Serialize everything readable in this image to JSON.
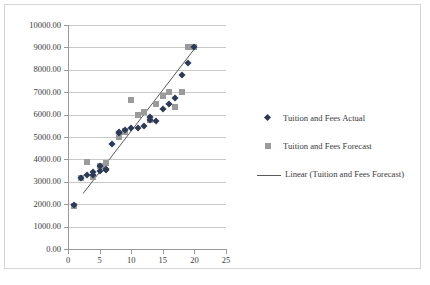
{
  "chart_data": {
    "type": "scatter",
    "title": "",
    "xlabel": "",
    "ylabel": "",
    "xlim": [
      0,
      25
    ],
    "ylim": [
      0,
      10000
    ],
    "grid": true,
    "legend_position": "right",
    "y_ticks": [
      "0.00",
      "1000.00",
      "2000.00",
      "3000.00",
      "4000.00",
      "5000.00",
      "6000.00",
      "7000.00",
      "8000.00",
      "9000.00",
      "10000.00"
    ],
    "y_tick_values": [
      0,
      1000,
      2000,
      3000,
      4000,
      5000,
      6000,
      7000,
      8000,
      9000,
      10000
    ],
    "x_ticks": [
      "0",
      "5",
      "10",
      "15",
      "20",
      "25"
    ],
    "x_tick_values": [
      0,
      5,
      10,
      15,
      20,
      25
    ],
    "series": [
      {
        "name": "Tuition and Fees Actual",
        "marker": "diamond",
        "color": "#2d3a55",
        "points": [
          [
            1,
            1950
          ],
          [
            2,
            3170
          ],
          [
            3,
            3300
          ],
          [
            4,
            3320
          ],
          [
            4,
            3420
          ],
          [
            5,
            3480
          ],
          [
            5,
            3700
          ],
          [
            6,
            3520
          ],
          [
            6,
            3560
          ],
          [
            7,
            4700
          ],
          [
            8,
            5180
          ],
          [
            8,
            5230
          ],
          [
            9,
            5330
          ],
          [
            10,
            5420
          ],
          [
            11,
            5400
          ],
          [
            12,
            5500
          ],
          [
            13,
            5900
          ],
          [
            13,
            5760
          ],
          [
            14,
            5720
          ],
          [
            15,
            6240
          ],
          [
            16,
            6480
          ],
          [
            17,
            6720
          ],
          [
            18,
            7760
          ],
          [
            19,
            8320
          ],
          [
            20,
            9030
          ]
        ]
      },
      {
        "name": "Tuition and Fees Forecast",
        "marker": "square",
        "color": "#9b9b9b",
        "points": [
          [
            1,
            1920
          ],
          [
            2,
            3180
          ],
          [
            3,
            3880
          ],
          [
            4,
            3200
          ],
          [
            5,
            3720
          ],
          [
            6,
            3820
          ],
          [
            8,
            4980
          ],
          [
            9,
            5230
          ],
          [
            9,
            5280
          ],
          [
            10,
            6640
          ],
          [
            11,
            5960
          ],
          [
            12,
            6120
          ],
          [
            13,
            5780
          ],
          [
            14,
            6460
          ],
          [
            15,
            6840
          ],
          [
            16,
            7000
          ],
          [
            17,
            6320
          ],
          [
            18,
            7000
          ],
          [
            19,
            9000
          ],
          [
            20,
            9040
          ]
        ]
      }
    ],
    "trendline": {
      "name": "Linear (Tuition and Fees Forecast)",
      "color": "#5a5a5a",
      "x_start": 2.4,
      "y_start": 2480,
      "x_end": 20.4,
      "y_end": 9080
    },
    "legend": [
      {
        "label": "Tuition and Fees Actual",
        "marker": "diamond"
      },
      {
        "label": "Tuition and Fees Forecast",
        "marker": "square"
      },
      {
        "label": "Linear (Tuition and Fees Forecast)",
        "marker": "line"
      }
    ]
  },
  "caption": {
    "text": ""
  }
}
